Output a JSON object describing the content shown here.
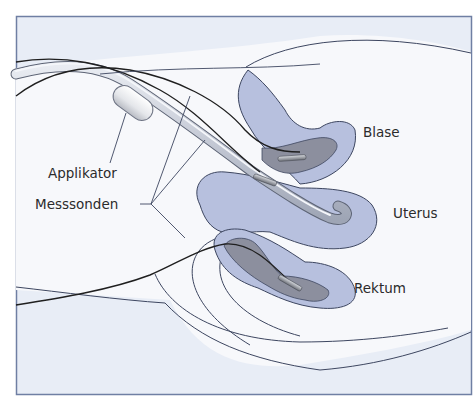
{
  "figure": {
    "labels": {
      "applikator": "Applikator",
      "messsonden": "Messsonden",
      "blase": "Blase",
      "uterus": "Uterus",
      "rektum": "Rektum"
    },
    "colors": {
      "background": "#e8edf6",
      "frame": "#6f7fa3",
      "organ_outer": "#b7c0de",
      "organ_inner": "#8c8f9e",
      "applicator": "#c9ced9",
      "lines": "#2a2a2a",
      "outline": "#3d4660"
    }
  }
}
